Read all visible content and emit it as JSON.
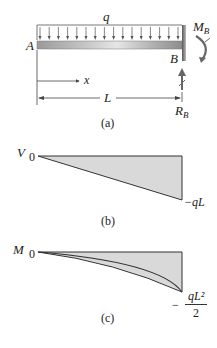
{
  "figure_a": {
    "caption": "(a)",
    "load_label": "q",
    "point_a": "A",
    "point_b": "B",
    "moment_label": "M",
    "moment_sub": "B",
    "reaction_label": "R",
    "reaction_sub": "B",
    "x_label": "x",
    "length_label": "L",
    "load_arrow_count": 16
  },
  "figure_b": {
    "caption": "(b)",
    "axis_label": "V",
    "origin_value": "0",
    "end_value": "−qL"
  },
  "figure_c": {
    "caption": "(c)",
    "axis_label": "M",
    "origin_value": "0",
    "end_value_sign": "−",
    "end_value_numerator": "qL²",
    "end_value_denominator": "2"
  },
  "colors": {
    "line": "#333333",
    "fill": "#d9d9d9",
    "beam_dark": "#8a8a8a",
    "beam_light": "#d8d8d8"
  }
}
